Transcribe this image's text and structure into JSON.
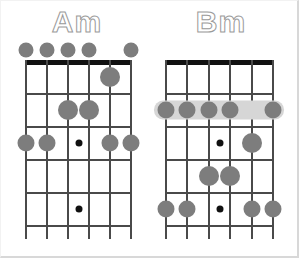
{
  "page": {
    "background_color": "#ffffff",
    "marker_color": "#7d7d7d",
    "line_color": "#4a4a4a",
    "nut_color": "#111111",
    "barre_color": "#d6d6d6",
    "inlay_color": "#111111",
    "title_outline_color": "#9a9a9a"
  },
  "diagrams": [
    {
      "id": "am",
      "name": "Am",
      "label": "Am",
      "strings": 6,
      "frets": 5,
      "has_nut": true,
      "open_markers": [
        {
          "string": 6,
          "x": 11
        },
        {
          "string": 5,
          "x": 32
        },
        {
          "string": 4,
          "x": 53
        },
        {
          "string": 3,
          "x": 74
        },
        {
          "string": 1,
          "x": 116
        }
      ],
      "fingerings": [
        {
          "string": 2,
          "fret": 1,
          "size": "big"
        },
        {
          "string": 4,
          "fret": 2,
          "size": "big"
        },
        {
          "string": 3,
          "fret": 2,
          "size": "big"
        },
        {
          "string": 6,
          "fret": 3,
          "size": "normal"
        },
        {
          "string": 5,
          "fret": 3,
          "size": "normal"
        },
        {
          "string": 2,
          "fret": 3,
          "size": "normal"
        },
        {
          "string": 1,
          "fret": 3,
          "size": "normal"
        }
      ],
      "inlays": [
        {
          "fret": 3,
          "between_strings": "3-4"
        },
        {
          "fret": 5,
          "between_strings": "3-4"
        }
      ],
      "barre": null
    },
    {
      "id": "bm",
      "name": "Bm",
      "label": "Bm",
      "strings": 6,
      "frets": 5,
      "has_nut": true,
      "open_markers": [],
      "fingerings": [
        {
          "string": 6,
          "fret": 2,
          "size": "normal"
        },
        {
          "string": 5,
          "fret": 2,
          "size": "normal"
        },
        {
          "string": 4,
          "fret": 2,
          "size": "normal"
        },
        {
          "string": 3,
          "fret": 2,
          "size": "normal"
        },
        {
          "string": 1,
          "fret": 2,
          "size": "normal"
        },
        {
          "string": 2,
          "fret": 3,
          "size": "big"
        },
        {
          "string": 4,
          "fret": 4,
          "size": "big"
        },
        {
          "string": 3,
          "fret": 4,
          "size": "big"
        },
        {
          "string": 6,
          "fret": 5,
          "size": "normal"
        },
        {
          "string": 5,
          "fret": 5,
          "size": "normal"
        },
        {
          "string": 2,
          "fret": 5,
          "size": "normal"
        },
        {
          "string": 1,
          "fret": 5,
          "size": "normal"
        }
      ],
      "inlays": [
        {
          "fret": 3,
          "between_strings": "3-4"
        },
        {
          "fret": 5,
          "between_strings": "3-4"
        }
      ],
      "barre": {
        "fret": 2,
        "from_string": 6,
        "to_string": 1
      }
    }
  ]
}
